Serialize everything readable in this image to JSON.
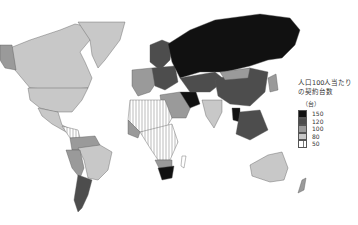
{
  "map": {
    "title_line1": "人口100人当たり",
    "title_line2": "の契約台数",
    "unit": "（台）",
    "legend": [
      {
        "label": "150",
        "color": "#111111",
        "pattern": "solid"
      },
      {
        "label": "120",
        "color": "#4d4d4d",
        "pattern": "solid"
      },
      {
        "label": "100",
        "color": "#9a9a9a",
        "pattern": "solid"
      },
      {
        "label": "80",
        "color": "#c8c8c8",
        "pattern": "solid"
      },
      {
        "label": "50",
        "color": "#ffffff",
        "pattern": "vertical-hatch"
      }
    ],
    "regions": [
      {
        "name": "Canada",
        "class": "80"
      },
      {
        "name": "United States",
        "class": "100"
      },
      {
        "name": "Greenland",
        "class": "80"
      },
      {
        "name": "Mexico",
        "class": "80"
      },
      {
        "name": "Central America",
        "class": "50"
      },
      {
        "name": "Brazil",
        "class": "80"
      },
      {
        "name": "Argentina",
        "class": "120"
      },
      {
        "name": "Chile",
        "class": "100"
      },
      {
        "name": "Western Europe",
        "class": "100"
      },
      {
        "name": "Eastern Europe",
        "class": "120"
      },
      {
        "name": "Russia",
        "class": "150"
      },
      {
        "name": "Central Asia",
        "class": "120"
      },
      {
        "name": "China",
        "class": "100"
      },
      {
        "name": "Middle East",
        "class": "100"
      },
      {
        "name": "Iran",
        "class": "150"
      },
      {
        "name": "India",
        "class": "80"
      },
      {
        "name": "Southeast Asia",
        "class": "120"
      },
      {
        "name": "Thailand",
        "class": "150"
      },
      {
        "name": "North Africa",
        "class": "50"
      },
      {
        "name": "Sub-Saharan Africa",
        "class": "50"
      },
      {
        "name": "South Africa",
        "class": "150"
      },
      {
        "name": "Australia",
        "class": "80"
      },
      {
        "name": "New Zealand",
        "class": "100"
      }
    ]
  }
}
